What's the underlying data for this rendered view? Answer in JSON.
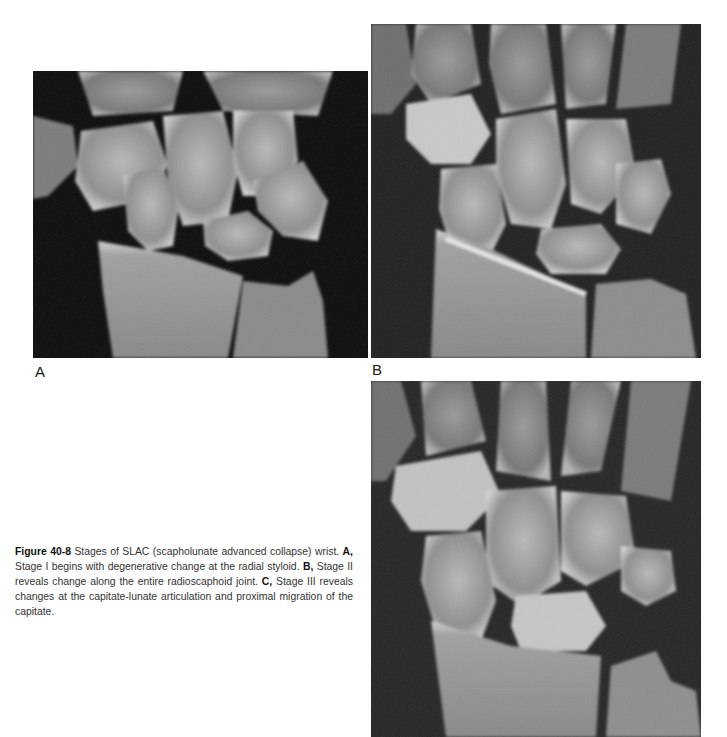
{
  "figure": {
    "number": "Figure 40-8",
    "title_text": " Stages of SLAC (scapholunate advanced collapse) wrist. ",
    "panels": [
      {
        "label": "A",
        "desc_label": "A,",
        "description": " Stage I begins with degenerative change at the radial styloid. "
      },
      {
        "label": "B",
        "desc_label": "B,",
        "description": " Stage II reveals change along the entire radioscaphoid joint. "
      },
      {
        "label": "C",
        "desc_label": "C,",
        "description": " Stage III reveals changes at the capitate-lunate articulation and proximal migration of the capitate."
      }
    ],
    "images": [
      {
        "label": "A",
        "content": "X-ray, PA wrist, stage I SLAC"
      },
      {
        "label": "B",
        "content": "X-ray, PA wrist, stage II SLAC"
      },
      {
        "label": "C",
        "content": "X-ray, PA wrist, stage III SLAC"
      }
    ]
  }
}
